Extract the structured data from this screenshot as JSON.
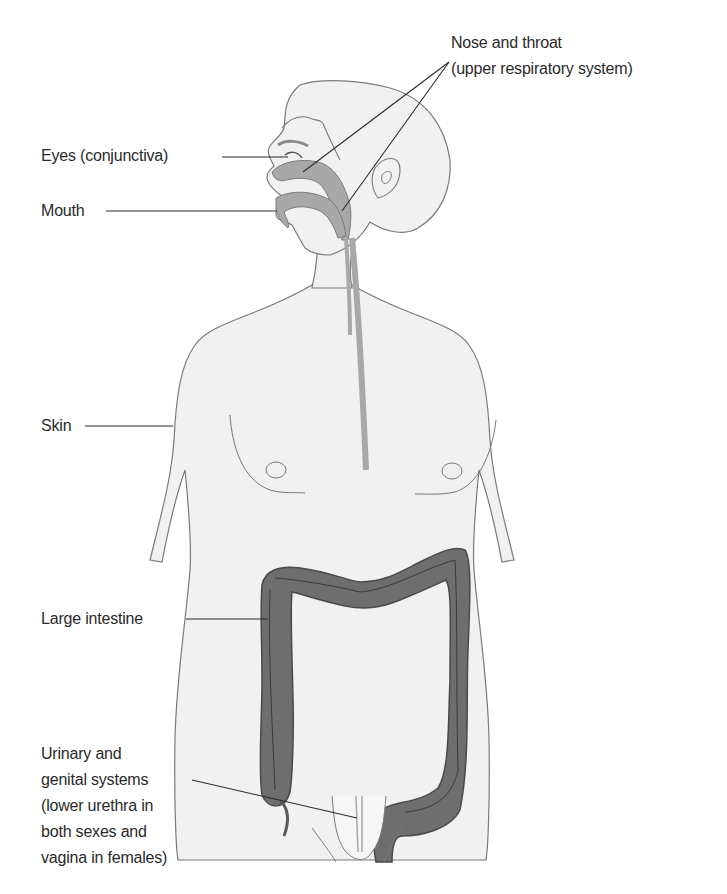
{
  "figure": {
    "colors": {
      "background": "#ffffff",
      "body_fill": "#f1f1f1",
      "body_outline": "#7a7a7a",
      "respiratory_tract": "#a8a8a8",
      "large_intestine": "#6e6e6e",
      "leader_line": "#2a2a2a",
      "text": "#2a2a2a"
    }
  },
  "labels": {
    "nose_throat_line1": "Nose and throat",
    "nose_throat_line2": "(upper respiratory system)",
    "eyes": "Eyes (conjunctiva)",
    "mouth": "Mouth",
    "skin": "Skin",
    "large_intestine": "Large intestine",
    "urogenital_line1": "Urinary and",
    "urogenital_line2": "genital systems",
    "urogenital_line3": "(lower urethra in",
    "urogenital_line4": "both sexes and",
    "urogenital_line5": "vagina in females)"
  }
}
